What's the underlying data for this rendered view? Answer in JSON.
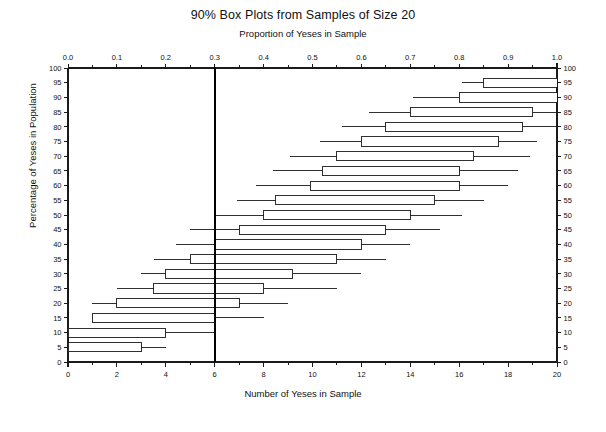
{
  "chart_data": {
    "type": "box",
    "title": "90% Box Plots from Samples of Size 20",
    "subtitle": "Proportion of Yeses in Sample",
    "xlabel": "Number of Yeses in Sample",
    "ylabel": "Percentage of Yeses in Population",
    "top_axis_label": "Proportion of Yeses in Sample",
    "bottom_axis_label": "Number of Yeses in Sample",
    "left_axis_label": "Percentage of Yeses in Population",
    "right_axis_label": "Percentage of Yeses in Population",
    "xlim": [
      0,
      20
    ],
    "ylim": [
      0,
      100
    ],
    "grid": false,
    "legend": null,
    "reference_line": {
      "orientation": "vertical",
      "value_count": 6,
      "value_proportion": 0.3,
      "label": "0.3",
      "color": "#000000",
      "width_px": 2.4
    },
    "top_ticks": [
      "0.0",
      "0.1",
      "0.2",
      "0.3",
      "0.4",
      "0.5",
      "0.6",
      "0.7",
      "0.8",
      "0.9",
      "1.0"
    ],
    "top_tick_values": [
      0.0,
      0.1,
      0.2,
      0.3,
      0.4,
      0.5,
      0.6,
      0.7,
      0.8,
      0.9,
      1.0
    ],
    "top_minor_ticks": [
      0.05,
      0.15,
      0.25,
      0.35,
      0.45,
      0.55,
      0.65,
      0.75,
      0.85,
      0.95
    ],
    "bottom_ticks": [
      "0",
      "2",
      "4",
      "6",
      "8",
      "10",
      "12",
      "14",
      "16",
      "18",
      "20"
    ],
    "bottom_tick_values": [
      0,
      2,
      4,
      6,
      8,
      10,
      12,
      14,
      16,
      18,
      20
    ],
    "bottom_minor_ticks": [
      1,
      3,
      5,
      7,
      9,
      11,
      13,
      15,
      17,
      19
    ],
    "y_ticks": [
      "0",
      "5",
      "10",
      "15",
      "20",
      "25",
      "30",
      "35",
      "40",
      "45",
      "50",
      "55",
      "60",
      "65",
      "70",
      "75",
      "80",
      "85",
      "90",
      "95",
      "100"
    ],
    "y_tick_values": [
      0,
      5,
      10,
      15,
      20,
      25,
      30,
      35,
      40,
      45,
      50,
      55,
      60,
      65,
      70,
      75,
      80,
      85,
      90,
      95,
      100
    ],
    "boxes": [
      {
        "y": 100,
        "lower_whisker": 20.0,
        "q1": 20.0,
        "median": 20.0,
        "q3": 20.0,
        "upper_whisker": 20.0
      },
      {
        "y": 95,
        "lower_whisker": 16.1,
        "q1": 17.0,
        "median": 19.0,
        "q3": 20.0,
        "upper_whisker": 20.0
      },
      {
        "y": 90,
        "lower_whisker": 14.1,
        "q1": 16.0,
        "median": 18.0,
        "q3": 20.0,
        "upper_whisker": 20.0
      },
      {
        "y": 85,
        "lower_whisker": 12.3,
        "q1": 14.0,
        "median": 17.0,
        "q3": 19.0,
        "upper_whisker": 20.0
      },
      {
        "y": 80,
        "lower_whisker": 11.2,
        "q1": 13.0,
        "median": 16.0,
        "q3": 18.6,
        "upper_whisker": 20.0
      },
      {
        "y": 75,
        "lower_whisker": 10.3,
        "q1": 12.0,
        "median": 15.0,
        "q3": 17.6,
        "upper_whisker": 19.2
      },
      {
        "y": 70,
        "lower_whisker": 9.1,
        "q1": 11.0,
        "median": 14.0,
        "q3": 16.6,
        "upper_whisker": 18.9
      },
      {
        "y": 65,
        "lower_whisker": 8.4,
        "q1": 10.4,
        "median": 13.0,
        "q3": 16.0,
        "upper_whisker": 18.4
      },
      {
        "y": 60,
        "lower_whisker": 7.7,
        "q1": 9.9,
        "median": 12.0,
        "q3": 16.0,
        "upper_whisker": 18.0
      },
      {
        "y": 55,
        "lower_whisker": 6.9,
        "q1": 8.5,
        "median": 11.0,
        "q3": 15.0,
        "upper_whisker": 17.0
      },
      {
        "y": 50,
        "lower_whisker": 6.0,
        "q1": 8.0,
        "median": 10.0,
        "q3": 14.0,
        "upper_whisker": 16.1
      },
      {
        "y": 45,
        "lower_whisker": 5.0,
        "q1": 7.0,
        "median": 9.0,
        "q3": 13.0,
        "upper_whisker": 15.2
      },
      {
        "y": 40,
        "lower_whisker": 4.4,
        "q1": 6.0,
        "median": 8.0,
        "q3": 12.0,
        "upper_whisker": 14.0
      },
      {
        "y": 35,
        "lower_whisker": 3.5,
        "q1": 5.0,
        "median": 7.0,
        "q3": 11.0,
        "upper_whisker": 13.0
      },
      {
        "y": 30,
        "lower_whisker": 3.0,
        "q1": 4.0,
        "median": 6.0,
        "q3": 9.2,
        "upper_whisker": 12.0
      },
      {
        "y": 25,
        "lower_whisker": 2.0,
        "q1": 3.5,
        "median": 5.0,
        "q3": 8.0,
        "upper_whisker": 11.0
      },
      {
        "y": 20,
        "lower_whisker": 1.0,
        "q1": 2.0,
        "median": 4.0,
        "q3": 7.0,
        "upper_whisker": 9.0
      },
      {
        "y": 15,
        "lower_whisker": 1.0,
        "q1": 1.0,
        "median": 3.0,
        "q3": 6.0,
        "upper_whisker": 8.0
      },
      {
        "y": 10,
        "lower_whisker": 0.0,
        "q1": 0.0,
        "median": 2.0,
        "q3": 4.0,
        "upper_whisker": 6.0
      },
      {
        "y": 5,
        "lower_whisker": 0.0,
        "q1": 0.0,
        "median": 1.0,
        "q3": 3.0,
        "upper_whisker": 4.0
      },
      {
        "y": 0,
        "lower_whisker": 0.0,
        "q1": 0.0,
        "median": 0.0,
        "q3": 0.0,
        "upper_whisker": 0.0
      }
    ]
  },
  "colors": {
    "axis": "#1a1a1a",
    "box_stroke": "#1a1a1a",
    "box_fill": "#ffffff",
    "reference_line": "#000000",
    "background": "#ffffff"
  },
  "layout": {
    "plot_left_px": 68,
    "plot_right_px": 557,
    "plot_top_px": 68,
    "plot_bottom_px": 362
  }
}
